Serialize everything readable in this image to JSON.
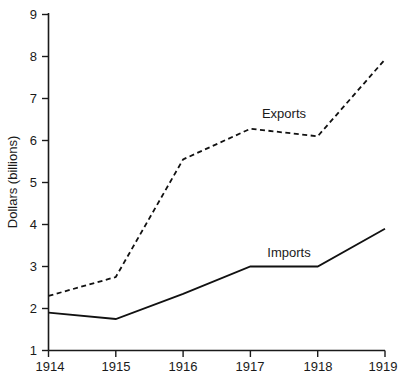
{
  "chart_data": {
    "type": "line",
    "title": "",
    "xlabel": "",
    "ylabel": "Dollars (billions)",
    "categories": [
      "1914",
      "1915",
      "1916",
      "1917",
      "1918",
      "1919"
    ],
    "x": [
      1914,
      1915,
      1916,
      1917,
      1918,
      1919
    ],
    "xlim": [
      1914,
      1919
    ],
    "ylim": [
      1,
      9
    ],
    "y_ticks": [
      "1",
      "2",
      "3",
      "4",
      "5",
      "6",
      "7",
      "8",
      "9"
    ],
    "y_tick_values": [
      1,
      2,
      3,
      4,
      5,
      6,
      7,
      8,
      9
    ],
    "x_ticks": [
      "1914",
      "1915",
      "1916",
      "1917",
      "1918",
      "1919"
    ],
    "grid": false,
    "legend": "inline-labels",
    "series": [
      {
        "name": "Exports",
        "style": "dashed",
        "color": "#111111",
        "values": [
          2.3,
          2.75,
          5.55,
          6.28,
          6.1,
          7.93
        ]
      },
      {
        "name": "Imports",
        "style": "solid",
        "color": "#111111",
        "values": [
          1.9,
          1.75,
          2.35,
          3.0,
          3.0,
          3.9
        ]
      }
    ],
    "annotations": [
      {
        "text": "Exports",
        "x": 1917.15,
        "y": 6.85
      },
      {
        "text": "Imports",
        "x": 1917.3,
        "y": 3.45
      }
    ]
  }
}
